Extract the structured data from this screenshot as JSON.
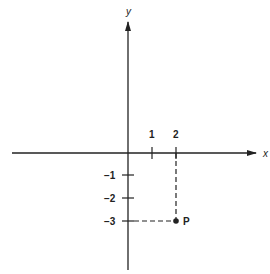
{
  "diagram": {
    "axes": {
      "x_label": "x",
      "y_label": "y"
    },
    "x_ticks": [
      {
        "value": 1,
        "label": "1"
      },
      {
        "value": 2,
        "label": "2"
      }
    ],
    "y_ticks": [
      {
        "value": -1,
        "label": "−1"
      },
      {
        "value": -2,
        "label": "−2"
      },
      {
        "value": -3,
        "label": "−3"
      }
    ],
    "point": {
      "label": "P",
      "x": 2,
      "y": -3
    },
    "colors": {
      "line": "#222222",
      "background": "#ffffff"
    }
  }
}
